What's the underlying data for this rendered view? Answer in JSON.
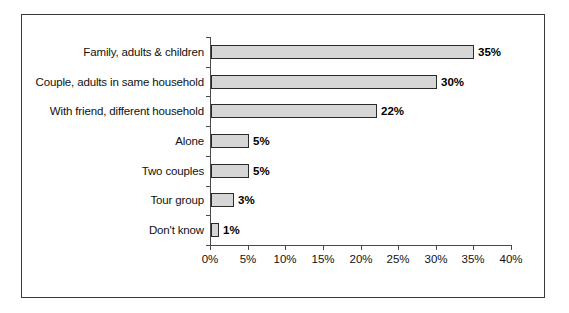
{
  "chart_data": {
    "type": "bar",
    "orientation": "horizontal",
    "title": "",
    "subtitle": "",
    "xlabel": "",
    "ylabel": "",
    "categories": [
      "Family, adults & children",
      "Couple, adults in same household",
      "With friend, different household",
      "Alone",
      "Two couples",
      "Tour group",
      "Don't know"
    ],
    "values": [
      35,
      30,
      22,
      5,
      5,
      3,
      1
    ],
    "data_labels": [
      "35%",
      "30%",
      "22%",
      "5%",
      "5%",
      "3%",
      "1%"
    ],
    "xlim": [
      0,
      40
    ],
    "xticks": [
      0,
      5,
      10,
      15,
      20,
      25,
      30,
      35,
      40
    ],
    "xtick_labels": [
      "0%",
      "5%",
      "10%",
      "15%",
      "20%",
      "25%",
      "30%",
      "35%",
      "40%"
    ],
    "grid": false,
    "legend": null,
    "colors": {
      "bar_fill": "#d6d6d6",
      "bar_border": "#2b2b2b",
      "axis": "#4a4a4a",
      "text": "#111111",
      "frame": "#3a3a3a",
      "background": "#ffffff"
    }
  }
}
